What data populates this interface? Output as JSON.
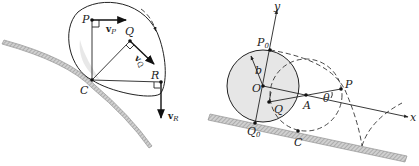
{
  "left_figure": {
    "points": {
      "P": "P",
      "Q": "Q",
      "R": "R",
      "C": "C"
    },
    "vectors": {
      "vP": {
        "main": "v",
        "sub": "P"
      },
      "vQ": {
        "main": "v",
        "sub": "Q"
      },
      "vR": {
        "main": "v",
        "sub": "R"
      }
    },
    "rotation_arrow": "clockwise"
  },
  "right_figure": {
    "points": {
      "P0": {
        "main": "P",
        "sub": "0"
      },
      "Q0": {
        "main": "Q",
        "sub": "0"
      },
      "O": "O",
      "Q": "Q",
      "A": "A",
      "P": "P",
      "C": "C"
    },
    "radius_label": "b",
    "angle_label": "θ",
    "axes": {
      "x": "x",
      "y": "y"
    }
  },
  "colors": {
    "ink": "#222222",
    "disk_fill": "#e6e6e6",
    "ground_hatch": "#9a9a9a"
  }
}
